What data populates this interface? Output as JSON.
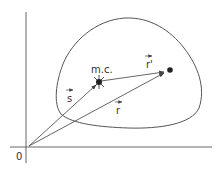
{
  "diagram": {
    "origin_label": "0",
    "center_of_mass_label": "m.c.",
    "vectors": [
      {
        "name": "s",
        "label": "s",
        "from": "origin",
        "to": "center-of-mass"
      },
      {
        "name": "r",
        "label": "r",
        "from": "origin",
        "to": "particle"
      },
      {
        "name": "r-prime",
        "label": "r'",
        "from": "center-of-mass",
        "to": "particle"
      }
    ],
    "points": [
      {
        "name": "center-of-mass",
        "label": "m.c."
      },
      {
        "name": "particle",
        "label": ""
      }
    ],
    "colors": {
      "stroke": "#555555",
      "text": "#333333",
      "background": "#ffffff"
    }
  }
}
